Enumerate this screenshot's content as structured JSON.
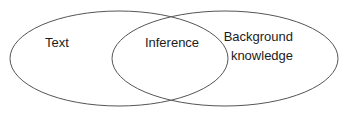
{
  "diagram": {
    "kind": "venn-diagram",
    "background_color": "#ffffff",
    "stroke_color": "#555555",
    "text_color": "#1c1c1c",
    "sets": [
      {
        "id": "text",
        "label": "Text",
        "label_x": 57,
        "label_y": 47,
        "ellipse": {
          "cx": 119,
          "cy": 58.5,
          "rx": 109,
          "ry": 47.5
        }
      },
      {
        "id": "background-knowledge",
        "label": "Background knowledge",
        "label_lines": [
          "Background",
          "knowledge"
        ],
        "label_x": 271,
        "label_y": 41,
        "label_line_height": 19,
        "ellipse": {
          "cx": 225,
          "cy": 58.5,
          "rx": 113,
          "ry": 47.5
        }
      }
    ],
    "intersection": {
      "id": "inference",
      "label": "Inference",
      "label_x": 172,
      "label_y": 47
    }
  }
}
